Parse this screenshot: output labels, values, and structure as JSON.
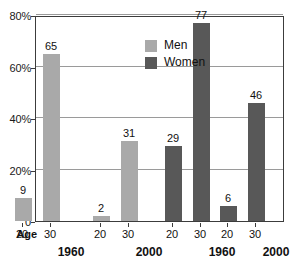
{
  "chart_data": {
    "type": "bar",
    "title": "",
    "subtitle": "",
    "xlabel": "Age",
    "ylabel": "",
    "ylim": [
      0,
      80
    ],
    "grid": true,
    "y_ticks": [
      0,
      20,
      40,
      60,
      80
    ],
    "y_tick_labels": [
      "0",
      "20%",
      "40%",
      "60%",
      "80%"
    ],
    "legend_position": "inside-upper-left",
    "legend": [
      "Men",
      "Women"
    ],
    "colors": {
      "men": "#a9a9a9",
      "women": "#585858",
      "frame": "#3c3c3c",
      "grid": "#9a9a9a",
      "text": "#111111",
      "background": "#ffffff"
    },
    "categories": [
      "20",
      "30",
      "20",
      "30",
      "20",
      "30",
      "20",
      "30"
    ],
    "groups": [
      {
        "series": "Men",
        "year": "1960",
        "ages": [
          "20",
          "30"
        ],
        "values": [
          9,
          65
        ]
      },
      {
        "series": "Men",
        "year": "2000",
        "ages": [
          "20",
          "30"
        ],
        "values": [
          2,
          31
        ]
      },
      {
        "series": "Women",
        "year": "1960",
        "ages": [
          "20",
          "30"
        ],
        "values": [
          29,
          77
        ]
      },
      {
        "series": "Women",
        "year": "2000",
        "ages": [
          "20",
          "30"
        ],
        "values": [
          6,
          46
        ]
      }
    ],
    "bars": [
      {
        "label": "9",
        "value": 9,
        "series": "Men",
        "year": "1960",
        "age": "20"
      },
      {
        "label": "65",
        "value": 65,
        "series": "Men",
        "year": "1960",
        "age": "30"
      },
      {
        "label": "2",
        "value": 2,
        "series": "Men",
        "year": "2000",
        "age": "20"
      },
      {
        "label": "31",
        "value": 31,
        "series": "Men",
        "year": "2000",
        "age": "30"
      },
      {
        "label": "29",
        "value": 29,
        "series": "Women",
        "year": "1960",
        "age": "20"
      },
      {
        "label": "77",
        "value": 77,
        "series": "Women",
        "year": "1960",
        "age": "30"
      },
      {
        "label": "6",
        "value": 6,
        "series": "Women",
        "year": "2000",
        "age": "20"
      },
      {
        "label": "46",
        "value": 46,
        "series": "Women",
        "year": "2000",
        "age": "30"
      }
    ],
    "year_labels": [
      "1960",
      "2000",
      "1960",
      "2000"
    ]
  },
  "axis": {
    "age_label": "Age",
    "y_ticks": [
      {
        "label": "80%",
        "value": 80
      },
      {
        "label": "60%",
        "value": 60
      },
      {
        "label": "40%",
        "value": 40
      },
      {
        "label": "20%",
        "value": 20
      },
      {
        "label": "0",
        "value": 0
      }
    ]
  },
  "legend": {
    "items": [
      {
        "label": "Men",
        "key": "men"
      },
      {
        "label": "Women",
        "key": "women"
      }
    ]
  }
}
